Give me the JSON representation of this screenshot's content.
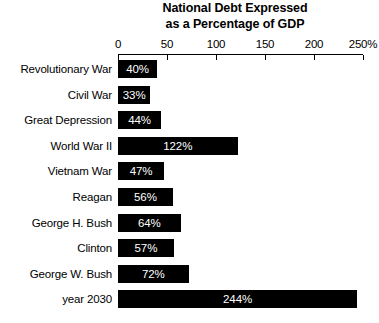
{
  "chart_data": {
    "type": "bar",
    "orientation": "horizontal",
    "title": "National Debt Expressed as a Percentage of GDP",
    "title_lines": [
      "National Debt Expressed",
      "as a Percentage of GDP"
    ],
    "xlabel": "",
    "ylabel": "",
    "xlim": [
      0,
      250
    ],
    "grid": false,
    "legend": null,
    "bar_color": "#000000",
    "value_label_color": "#ffffff",
    "background_color": "#ffffff",
    "axis_position": "top",
    "xticks": [
      {
        "value": 0,
        "label": "0"
      },
      {
        "value": 50,
        "label": "50"
      },
      {
        "value": 100,
        "label": "100"
      },
      {
        "value": 150,
        "label": "150"
      },
      {
        "value": 200,
        "label": "200"
      },
      {
        "value": 250,
        "label": "250%"
      }
    ],
    "categories": [
      "Revolutionary War",
      "Civil War",
      "Great Depression",
      "World War II",
      "Vietnam War",
      "Reagan",
      "George H. Bush",
      "Clinton",
      "George W. Bush",
      "year 2030"
    ],
    "values": [
      40,
      33,
      44,
      122,
      47,
      56,
      64,
      57,
      72,
      244
    ],
    "value_labels": [
      "40%",
      "33%",
      "44%",
      "122%",
      "47%",
      "56%",
      "64%",
      "57%",
      "72%",
      "244%"
    ]
  }
}
